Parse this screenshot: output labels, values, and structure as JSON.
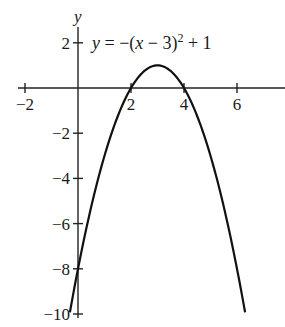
{
  "chart_data": {
    "type": "line",
    "title": "",
    "xlabel": "",
    "ylabel": "y",
    "equation": {
      "prefix": "y",
      "eq": " = −(",
      "var": "x",
      "rest": " − 3)",
      "exp": "2",
      "tail": " + 1"
    },
    "function": "y = -(x - 3)^2 + 1",
    "series": [
      {
        "name": "y = −(x − 3)² + 1",
        "x": [
          -0.3,
          0,
          0.5,
          1,
          1.5,
          2,
          2.5,
          3,
          3.5,
          4,
          4.5,
          5,
          5.5,
          6,
          6.3
        ],
        "y": [
          -9.89,
          -8,
          -5.25,
          -3,
          -1.25,
          0,
          0.75,
          1,
          0.75,
          0,
          -1.25,
          -3,
          -5.25,
          -8,
          -9.89
        ]
      }
    ],
    "key_points": {
      "vertex": [
        3,
        1
      ],
      "x_intercepts": [
        2,
        4
      ],
      "y_intercept": -8
    },
    "xlim": [
      -2.3,
      7.7
    ],
    "ylim": [
      -10.3,
      2.7
    ],
    "x_ticks": [
      {
        "value": -2,
        "label": "−2"
      },
      {
        "value": 2,
        "label": "2"
      },
      {
        "value": 4,
        "label": "4"
      },
      {
        "value": 6,
        "label": "6"
      }
    ],
    "y_ticks": [
      {
        "value": 2,
        "label": "2"
      },
      {
        "value": -2,
        "label": "−2"
      },
      {
        "value": -4,
        "label": "−4"
      },
      {
        "value": -6,
        "label": "−6"
      },
      {
        "value": -8,
        "label": "−8"
      },
      {
        "value": -10,
        "label": "−10"
      }
    ],
    "grid": false,
    "legend": "none",
    "colors": {
      "curve": "#111111",
      "axes": "#222222",
      "background": "#ffffff"
    }
  }
}
